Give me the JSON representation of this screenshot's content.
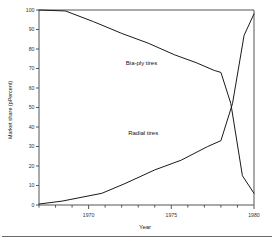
{
  "chart_data": {
    "type": "line",
    "title": "",
    "xlabel": "Year",
    "ylabel": "Market share (pPercent)",
    "xlim": [
      1967,
      1980
    ],
    "ylim": [
      0,
      100
    ],
    "xticks": [
      1970,
      1975,
      1980
    ],
    "xtick_labels": [
      "1970",
      "1975",
      "1980"
    ],
    "yticks": [
      0,
      10,
      20,
      30,
      40,
      50,
      60,
      70,
      80,
      90,
      100
    ],
    "ytick_labels": [
      "0",
      "10",
      "20",
      "30",
      "40",
      "50",
      "60",
      "70",
      "80",
      "90",
      "100"
    ],
    "grid": false,
    "legend_position": "inline-annotations",
    "series": [
      {
        "name": "Bia-ply tires",
        "label_x": 1973.2,
        "label_y": 72,
        "x": [
          1967.0,
          1968.6,
          1970.3,
          1972.0,
          1973.6,
          1975.2,
          1976.5,
          1977.6,
          1978.0,
          1978.6,
          1979.3,
          1980.0
        ],
        "y": [
          100,
          99.5,
          94,
          88,
          83,
          77,
          73,
          69,
          68,
          52,
          15,
          6
        ]
      },
      {
        "name": "Radial tires",
        "label_x": 1973.3,
        "label_y": 36,
        "x": [
          1967.0,
          1968.4,
          1969.6,
          1970.8,
          1972.2,
          1974.0,
          1975.6,
          1977.2,
          1978.0,
          1978.7,
          1979.4,
          1980.0
        ],
        "y": [
          0.5,
          2,
          4,
          6,
          11,
          18,
          23,
          30,
          33,
          52,
          87,
          98
        ]
      }
    ],
    "annotations": [
      "Bia-ply tires",
      "Radial tires"
    ]
  }
}
